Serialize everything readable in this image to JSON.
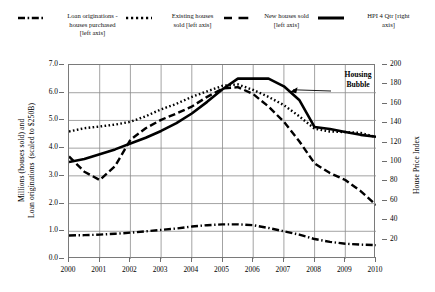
{
  "legend": {
    "items": [
      {
        "name": "loan-originations",
        "label": "Loan originations -\nhouses purchased\n[left axis]",
        "style": "dash-dot"
      },
      {
        "name": "existing-houses-sold",
        "label": "Existing houses\nsold [left axis]",
        "style": "dotted"
      },
      {
        "name": "new-houses-sold",
        "label": "New houses sold\n[left axis]",
        "style": "dashed"
      },
      {
        "name": "hpi-4-qtr",
        "label": "HPI 4 Qtr [right\naxis]",
        "style": "solid"
      }
    ]
  },
  "axes": {
    "left_title": "Millions (houses sold) and\nLoan originations  (scaled to $250B)",
    "right_title": "House Price Index",
    "left_ticks": [
      "0.0",
      "1.0",
      "2.0",
      "3.0",
      "4.0",
      "5.0",
      "6.0",
      "7.0"
    ],
    "right_ticks": [
      "20",
      "40",
      "60",
      "80",
      "100",
      "120",
      "140",
      "160",
      "180",
      "200"
    ],
    "x_ticks": [
      "2000",
      "2001",
      "2002",
      "2003",
      "2004",
      "2005",
      "2006",
      "2007",
      "2008",
      "2009",
      "2010"
    ]
  },
  "annotations": [
    {
      "name": "housing-bubble",
      "text": "Housing\nBubble"
    }
  ],
  "colors": {
    "line": "#000000",
    "grid": "#8c8c8c",
    "axis": "#6e6e6e",
    "background": "#ffffff"
  },
  "chart_data": {
    "type": "line",
    "title": "",
    "xlabel": "",
    "ylabel": "Millions (houses sold) and Loan originations  (scaled to $250B)",
    "y2label": "House Price Index",
    "xlim": [
      2000,
      2010
    ],
    "ylim": [
      0.0,
      7.0
    ],
    "y2lim": [
      0,
      200
    ],
    "grid": true,
    "legend_position": "top",
    "x": [
      2000,
      2000.5,
      2001,
      2001.5,
      2002,
      2002.5,
      2003,
      2003.5,
      2004,
      2004.5,
      2005,
      2005.5,
      2006,
      2006.5,
      2007,
      2007.5,
      2008,
      2008.5,
      2009,
      2009.5,
      2010
    ],
    "series": [
      {
        "name": "Loan originations - houses purchased [left axis]",
        "axis": "left",
        "style": "dash-dot",
        "units": "millions (scaled to $250B)",
        "values": [
          0.85,
          0.86,
          0.88,
          0.91,
          0.95,
          1.0,
          1.05,
          1.1,
          1.17,
          1.22,
          1.25,
          1.25,
          1.22,
          1.12,
          1.0,
          0.88,
          0.72,
          0.62,
          0.55,
          0.52,
          0.5
        ]
      },
      {
        "name": "Existing houses sold [left axis]",
        "axis": "left",
        "style": "dotted",
        "units": "millions",
        "values": [
          4.6,
          4.72,
          4.78,
          4.85,
          4.95,
          5.15,
          5.4,
          5.6,
          5.85,
          6.05,
          6.25,
          6.3,
          6.1,
          5.85,
          5.55,
          5.15,
          4.7,
          4.6,
          4.58,
          4.55,
          4.4
        ]
      },
      {
        "name": "New houses sold [left axis]",
        "axis": "left",
        "style": "dashed",
        "units": "millions",
        "values": [
          3.7,
          3.15,
          2.85,
          3.35,
          4.3,
          4.72,
          5.02,
          5.25,
          5.5,
          5.85,
          6.15,
          6.2,
          5.95,
          5.5,
          4.95,
          4.25,
          3.45,
          3.1,
          2.85,
          2.45,
          1.95
        ]
      },
      {
        "name": "HPI 4 Qtr [right axis]",
        "axis": "right",
        "style": "solid",
        "units": "index",
        "values": [
          100,
          103,
          108,
          113,
          119,
          125,
          132,
          140,
          150,
          162,
          175,
          186,
          186,
          186,
          178,
          164,
          136,
          134,
          131,
          128,
          126
        ]
      }
    ],
    "annotations": [
      {
        "text": "Housing Bubble",
        "points_to_x": 2007.2,
        "points_to_series": "HPI 4 Qtr [right axis]"
      }
    ]
  }
}
